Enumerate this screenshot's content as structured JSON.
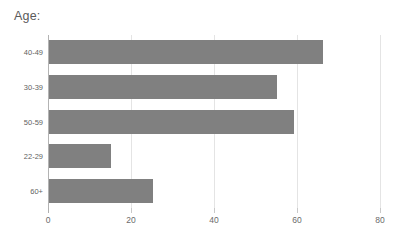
{
  "chart_data": {
    "type": "bar",
    "orientation": "horizontal",
    "title": "Age:",
    "xlabel": "",
    "ylabel": "",
    "categories": [
      "40-49",
      "30-39",
      "50-59",
      "22-29",
      "60+"
    ],
    "values": [
      66,
      55,
      59,
      15,
      25
    ],
    "xlim": [
      0,
      80
    ],
    "xticks": [
      0,
      20,
      40,
      60,
      80
    ],
    "xtick_labels": [
      "0",
      "20",
      "40",
      "60",
      "80"
    ],
    "grid": true,
    "grid_axis": "x",
    "legend": false,
    "legend_position": "none",
    "series": [
      {
        "name": "Age",
        "values": [
          66,
          55,
          59,
          15,
          25
        ]
      }
    ],
    "colors": {
      "bar": "#808080",
      "gridline": "#e4e4e4",
      "axis": "#b3b3b3",
      "text": "#5f5f5f",
      "background": "#ffffff"
    }
  }
}
